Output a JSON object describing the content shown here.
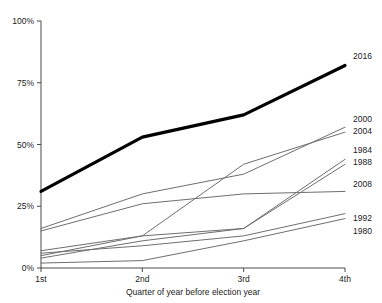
{
  "chart_data": {
    "type": "line",
    "title": "",
    "subtitle": "",
    "xlabel": "Quarter of year before election year",
    "ylabel": "",
    "categories": [
      "1st",
      "2nd",
      "3rd",
      "4th"
    ],
    "x_tick_labels": [
      "1st",
      "2nd",
      "3rd",
      "4th"
    ],
    "y_tick_labels": [
      "0%",
      "25%",
      "50%",
      "75%",
      "100%"
    ],
    "y_tick_values": [
      0,
      25,
      50,
      75,
      100
    ],
    "ylim": [
      0,
      100
    ],
    "xlim": [
      1,
      4
    ],
    "grid": false,
    "legend_position": "right-inline-end-of-line",
    "series": [
      {
        "name": "2016",
        "values": [
          31,
          53,
          62,
          82
        ],
        "color": "#000000",
        "highlight": true
      },
      {
        "name": "2000",
        "values": [
          16,
          30,
          38,
          57
        ],
        "color": "#6e6e6e",
        "highlight": false
      },
      {
        "name": "2004",
        "values": [
          7,
          13,
          42,
          55
        ],
        "color": "#6e6e6e",
        "highlight": false
      },
      {
        "name": "1984",
        "values": [
          5,
          13,
          16,
          44
        ],
        "color": "#6e6e6e",
        "highlight": false
      },
      {
        "name": "1988",
        "values": [
          4,
          11,
          16,
          42
        ],
        "color": "#6e6e6e",
        "highlight": false
      },
      {
        "name": "2008",
        "values": [
          15,
          26,
          30,
          31
        ],
        "color": "#6e6e6e",
        "highlight": false
      },
      {
        "name": "1992",
        "values": [
          6,
          9,
          13,
          22
        ],
        "color": "#6e6e6e",
        "highlight": false
      },
      {
        "name": "1980",
        "values": [
          2,
          3,
          11,
          20
        ],
        "color": "#6e6e6e",
        "highlight": false
      }
    ],
    "legend_entries": [
      "2016",
      "2000",
      "2004",
      "1984",
      "1988",
      "2008",
      "1992",
      "1980"
    ],
    "label_y_positions": [
      57,
      120,
      132,
      151,
      163,
      185,
      219,
      232
    ]
  }
}
